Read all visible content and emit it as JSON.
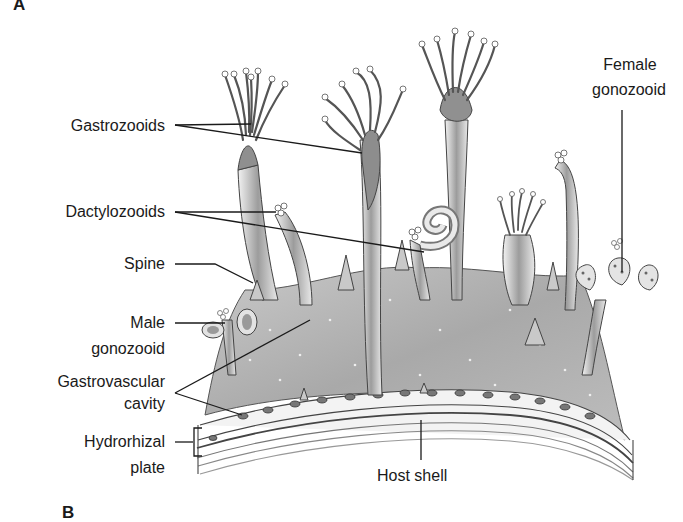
{
  "figure": {
    "panel_a": "A",
    "panel_b": "B",
    "labels": {
      "gastrozooids": "Gastrozooids",
      "dactylozooids": "Dactylozooids",
      "spine": "Spine",
      "male_gonozooid_1": "Male",
      "male_gonozooid_2": "gonozooid",
      "gastrovascular_1": "Gastrovascular",
      "gastrovascular_2": "cavity",
      "hydrorhizal_1": "Hydrorhizal",
      "hydrorhizal_2": "plate",
      "host_shell": "Host shell",
      "female_gonozooid_1": "Female",
      "female_gonozooid_2": "gonozooid"
    },
    "colors": {
      "ink": "#1a1a1a",
      "tissue_dark": "#8a8a8a",
      "tissue_mid": "#b5b5b5",
      "tissue_light": "#dcdcdc",
      "background": "#ffffff"
    }
  }
}
